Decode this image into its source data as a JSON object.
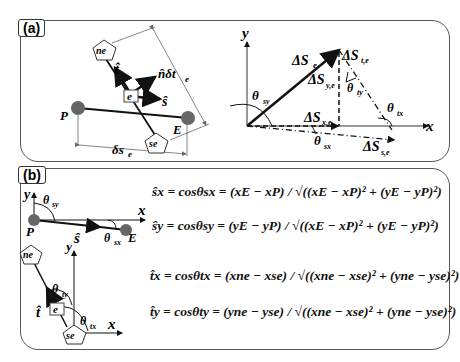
{
  "panel_a": {
    "label": "(a)",
    "left_figure": {
      "nodes": {
        "P": "P",
        "E": "E",
        "ne": "ne",
        "se": "se",
        "e": "e"
      },
      "vectors": {
        "t_hat": "t̂",
        "n_hat_dt": "n̂δt",
        "n_sub": "e",
        "s_hat": "ŝ"
      },
      "dimension": {
        "main": "δs",
        "sub": "e"
      }
    },
    "right_figure": {
      "axes": {
        "x": "x",
        "y": "y"
      },
      "labels": {
        "dS_e": "ΔS",
        "dS_e_sub": "e",
        "dS_te": "ΔS",
        "dS_te_sub": "t,e",
        "dS_ye": "ΔS",
        "dS_ye_sub": "y,e",
        "dS_xe": "ΔS",
        "dS_xe_sub": "x,e",
        "dS_se": "ΔS",
        "dS_se_sub": "s,e",
        "theta_sy": "θ",
        "theta_sy_sub": "sy",
        "theta_sx": "θ",
        "theta_sx_sub": "sx",
        "theta_ty": "θ",
        "theta_ty_sub": "ty",
        "theta_tx": "θ",
        "theta_tx_sub": "tx"
      }
    }
  },
  "panel_b": {
    "label": "(b)",
    "top_figure": {
      "axes": {
        "x": "x",
        "y": "y"
      },
      "P": "P",
      "E": "E",
      "s_hat": "ŝ",
      "theta_sy": "θ",
      "theta_sy_sub": "sy",
      "theta_sx": "θ",
      "theta_sx_sub": "sx"
    },
    "bottom_figure": {
      "axes": {
        "x": "x",
        "y": "y"
      },
      "ne": "ne",
      "se": "se",
      "e": "e",
      "t_hat": "t̂",
      "theta_ty": "θ",
      "theta_ty_sub": "ty",
      "theta_tx": "θ",
      "theta_tx_sub": "tx"
    },
    "equations": [
      "ŝx = cosθsx = (xE − xP) / √((xE − xP)² + (yE − yP)²)",
      "ŝy = cosθsy = (yE − yP) / √((xE − xP)² + (yE − yP)²)",
      "t̂x = cosθtx = (xne − xse) / √((xne − xse)² + (yne − yse)²)",
      "t̂y = cosθty = (yne − yse) / √((xne − xse)² + (yne − yse)²)"
    ]
  }
}
